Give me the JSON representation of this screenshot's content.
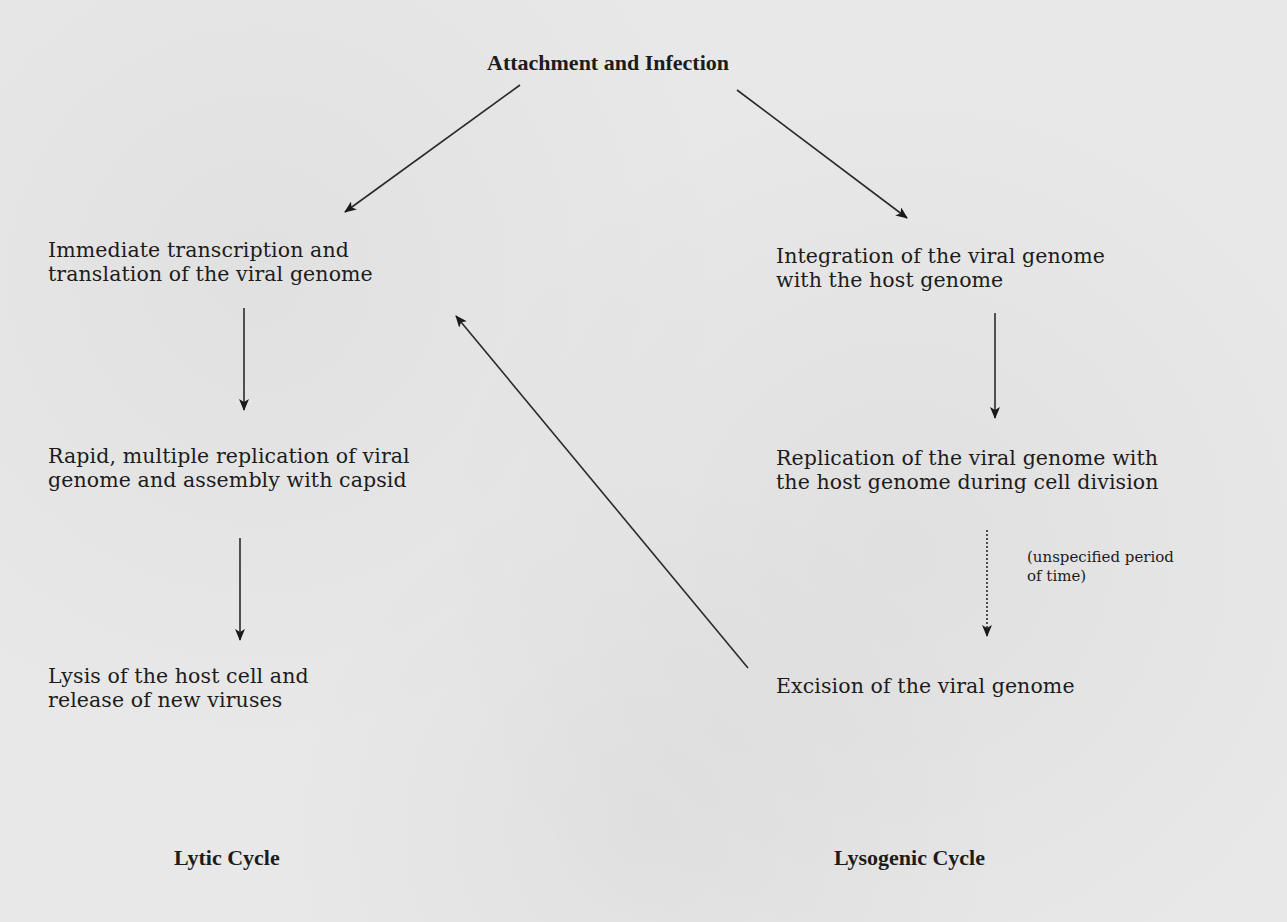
{
  "diagram": {
    "root": {
      "label": "Attachment and Infection"
    },
    "lytic": {
      "cycle_label": "Lytic Cycle",
      "steps": [
        {
          "lines": [
            "Immediate transcription and",
            "translation of the viral genome"
          ]
        },
        {
          "lines": [
            "Rapid, multiple replication of viral",
            "genome and assembly with capsid"
          ]
        },
        {
          "lines": [
            "Lysis of the host cell and",
            "release of new viruses"
          ]
        }
      ]
    },
    "lysogenic": {
      "cycle_label": "Lysogenic Cycle",
      "steps": [
        {
          "lines": [
            "Integration of the viral genome",
            "with the host genome"
          ]
        },
        {
          "lines": [
            "Replication of the viral genome with",
            "the host genome during cell division"
          ]
        },
        {
          "lines": [
            "Excision of the viral genome"
          ]
        }
      ],
      "time_note": {
        "lines": [
          "(unspecified period",
          "of time)"
        ]
      }
    },
    "edges": [
      {
        "from": "Attachment and Infection",
        "to": "Immediate transcription and translation of the viral genome",
        "style": "solid"
      },
      {
        "from": "Attachment and Infection",
        "to": "Integration of the viral genome with the host genome",
        "style": "solid"
      },
      {
        "from": "Immediate transcription and translation of the viral genome",
        "to": "Rapid, multiple replication of viral genome and assembly with capsid",
        "style": "solid"
      },
      {
        "from": "Rapid, multiple replication of viral genome and assembly with capsid",
        "to": "Lysis of the host cell and release of new viruses",
        "style": "solid"
      },
      {
        "from": "Integration of the viral genome with the host genome",
        "to": "Replication of the viral genome with the host genome during cell division",
        "style": "solid"
      },
      {
        "from": "Replication of the viral genome with the host genome during cell division",
        "to": "Excision of the viral genome",
        "style": "dotted",
        "label": "(unspecified period of time)"
      },
      {
        "from": "Excision of the viral genome",
        "to": "Immediate transcription and translation of the viral genome",
        "style": "solid"
      }
    ]
  }
}
